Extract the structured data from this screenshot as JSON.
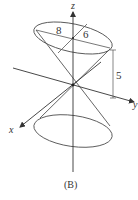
{
  "figure": {
    "caption": "(B)",
    "axes": {
      "x_label": "x",
      "y_label": "y",
      "z_label": "z"
    },
    "dimensions": {
      "major_axis_label": "8",
      "minor_axis_label": "6",
      "height_label": "5"
    },
    "colors": {
      "stroke": "#444444",
      "background": "#ffffff"
    }
  }
}
